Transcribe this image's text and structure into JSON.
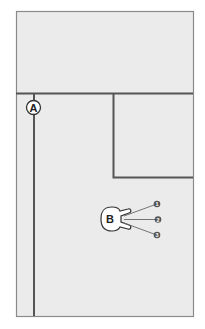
{
  "diagram": {
    "type": "floor-plan-schematic",
    "background": "#ffffff",
    "panel_fill": "#ebebeb",
    "frame_color": "#8a8a8a",
    "line_color": "#555555",
    "labels": {
      "a": "A",
      "b": "B",
      "callouts": [
        "1",
        "2",
        "3"
      ]
    }
  }
}
